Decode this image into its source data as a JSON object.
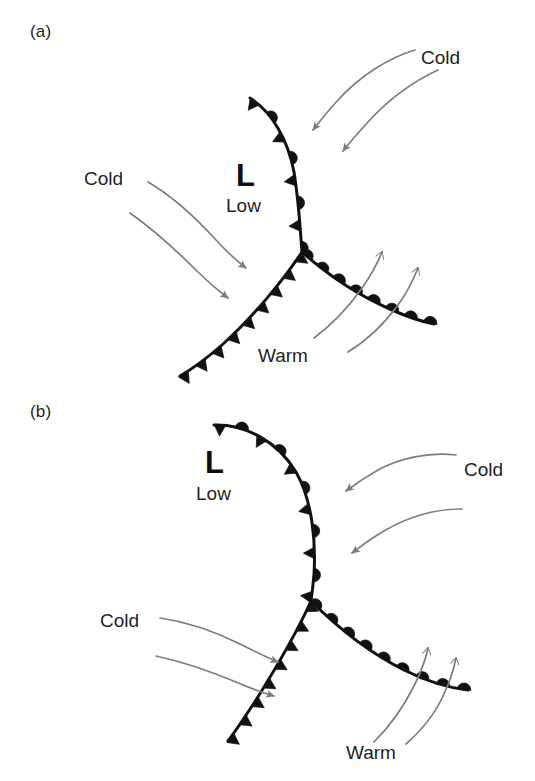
{
  "figure": {
    "kind": "weather-front-diagram",
    "background_color": "#ffffff",
    "front_color": "#111111",
    "arrow_color": "#7d7d7d",
    "text_color": "#231f20",
    "panels": [
      {
        "id": "a",
        "label": "(a)",
        "label_x": 30,
        "label_y": 22,
        "pressure_center": {
          "symbol": "L",
          "word": "Low",
          "symbol_x": 236,
          "symbol_y": 160,
          "word_x": 226,
          "word_y": 196
        },
        "labels": [
          {
            "name": "cold-label-upper-right",
            "text": "Cold",
            "x": 421,
            "y": 47
          },
          {
            "name": "cold-label-left",
            "text": "Cold",
            "x": 84,
            "y": 168
          },
          {
            "name": "warm-label-bottom",
            "text": "Warm",
            "x": 258,
            "y": 345
          }
        ],
        "fronts": [
          {
            "name": "occluded-front",
            "type": "occluded",
            "symbols": "alternating-triangle-semicircle",
            "symbol_side": "right",
            "path": "M 250,98 C 272,112 288,140 294,172 C 299,203 300,228 302,252"
          },
          {
            "name": "cold-front",
            "type": "cold",
            "symbols": "triangle",
            "symbol_side": "left",
            "path": "M 302,252 C 282,282 252,318 222,345 C 206,359 192,369 180,376"
          },
          {
            "name": "warm-front",
            "type": "warm",
            "symbols": "semicircle",
            "symbol_side": "top",
            "path": "M 302,252 C 330,277 362,297 392,310 C 410,318 424,322 434,324"
          }
        ],
        "arrows": [
          {
            "name": "cold-arrow-upper-right-1",
            "flow": "cold",
            "head": "solid",
            "path": "M 415,50 C 388,58 360,76 338,100 C 328,111 320,121 313,130"
          },
          {
            "name": "cold-arrow-upper-right-2",
            "flow": "cold",
            "head": "solid",
            "path": "M 438,70 C 412,82 388,100 368,122 C 358,133 350,142 343,151"
          },
          {
            "name": "cold-arrow-left-1",
            "flow": "cold",
            "head": "solid",
            "path": "M 148,182 C 172,196 196,218 216,240 C 228,253 238,262 246,268"
          },
          {
            "name": "cold-arrow-left-2",
            "flow": "cold",
            "head": "solid",
            "path": "M 130,213 C 154,230 178,252 198,272 C 210,284 220,292 228,298"
          },
          {
            "name": "warm-arrow-1",
            "flow": "warm",
            "head": "open",
            "path": "M 314,338 C 330,326 348,308 362,288 C 372,274 378,262 382,252"
          },
          {
            "name": "warm-arrow-2",
            "flow": "warm",
            "head": "open",
            "path": "M 348,352 C 366,341 384,324 398,305 C 409,290 414,278 418,268"
          }
        ]
      },
      {
        "id": "b",
        "label": "(b)",
        "label_x": 30,
        "label_y": 402,
        "pressure_center": {
          "symbol": "L",
          "word": "Low",
          "symbol_x": 205,
          "symbol_y": 447,
          "word_x": 196,
          "word_y": 484
        },
        "labels": [
          {
            "name": "cold-label-right",
            "text": "Cold",
            "x": 464,
            "y": 459
          },
          {
            "name": "cold-label-left",
            "text": "Cold",
            "x": 100,
            "y": 610
          },
          {
            "name": "warm-label-bottom",
            "text": "Warm",
            "x": 346,
            "y": 742
          }
        ],
        "fronts": [
          {
            "name": "occluded-front",
            "type": "occluded",
            "symbols": "alternating-triangle-semicircle",
            "symbol_side": "right",
            "path": "M 214,425 C 246,424 278,442 296,472 C 312,500 316,540 314,574 C 313,586 312,594 311,601"
          },
          {
            "name": "cold-front",
            "type": "cold",
            "symbols": "triangle",
            "symbol_side": "left",
            "path": "M 311,601 C 298,630 276,668 256,700 C 243,720 234,733 228,741"
          },
          {
            "name": "warm-front",
            "type": "warm",
            "symbols": "semicircle",
            "symbol_side": "top",
            "path": "M 311,601 C 338,628 372,654 404,670 C 428,682 450,688 468,690"
          }
        ],
        "arrows": [
          {
            "name": "cold-arrow-right-1",
            "flow": "cold",
            "head": "solid",
            "path": "M 456,455 C 428,452 400,458 378,470 C 364,478 354,485 346,491"
          },
          {
            "name": "cold-arrow-right-2",
            "flow": "cold",
            "head": "solid",
            "path": "M 462,509 C 434,509 406,518 384,531 C 370,539 360,547 352,553"
          },
          {
            "name": "cold-arrow-left-1",
            "flow": "cold",
            "head": "solid",
            "path": "M 160,618 C 188,622 216,632 240,644 C 256,652 268,658 278,662"
          },
          {
            "name": "cold-arrow-left-2",
            "flow": "cold",
            "head": "solid",
            "path": "M 156,656 C 184,662 212,672 236,682 C 252,689 264,693 274,696"
          },
          {
            "name": "warm-arrow-1",
            "flow": "warm",
            "head": "open",
            "path": "M 374,742 C 390,726 404,706 414,686 C 422,670 426,658 428,648"
          },
          {
            "name": "warm-arrow-2",
            "flow": "warm",
            "head": "open",
            "path": "M 406,744 C 422,730 436,712 444,694 C 451,679 454,668 456,658"
          }
        ]
      }
    ]
  }
}
